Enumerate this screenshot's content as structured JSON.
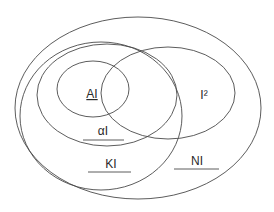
{
  "diagram": {
    "type": "venn / nested sets",
    "stroke_color": "#4a4a4a",
    "text_color": "#2a2a2a",
    "sets": [
      {
        "id": "NI",
        "label": "NI",
        "cx": 138,
        "cy": 108,
        "rx": 123,
        "ry": 91
      },
      {
        "id": "KI",
        "label": "KI",
        "cx": 101,
        "cy": 116,
        "rx": 81,
        "ry": 74
      },
      {
        "id": "alphaI",
        "label": "αI",
        "cx": 107,
        "cy": 95,
        "rx": 70,
        "ry": 51
      },
      {
        "id": "I2",
        "label": "I²",
        "cx": 168,
        "cy": 93,
        "rx": 67,
        "ry": 46
      },
      {
        "id": "AI",
        "label": "AI",
        "cx": 93,
        "cy": 89,
        "rx": 36,
        "ry": 28
      }
    ],
    "labels": {
      "AI": {
        "text": "AI",
        "x": 92,
        "y": 98,
        "underlined": true
      },
      "I2": {
        "text": "I²",
        "x": 204,
        "y": 99,
        "underlined": false
      },
      "alphaI": {
        "text": "αI",
        "x": 103,
        "y": 135,
        "rule": [
          83,
          140,
          124,
          140
        ]
      },
      "KI": {
        "text": "KI",
        "x": 111,
        "y": 168,
        "rule": [
          88,
          172,
          131,
          172
        ]
      },
      "NI": {
        "text": "NI",
        "x": 197,
        "y": 165,
        "rule": [
          174,
          169,
          219,
          169
        ]
      }
    }
  }
}
